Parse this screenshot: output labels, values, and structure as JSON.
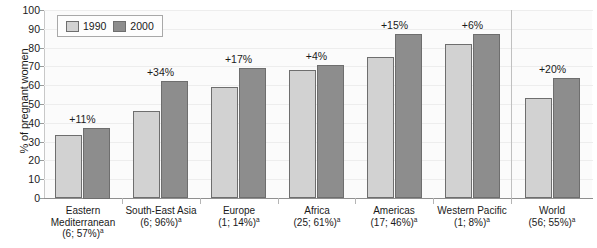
{
  "chart_data": {
    "type": "bar",
    "title": "",
    "xlabel": "",
    "ylabel": "% of pregnant women",
    "ylim": [
      0,
      100
    ],
    "ytick_labels": [
      "100",
      "90",
      "80",
      "70",
      "60",
      "50",
      "40",
      "30",
      "20",
      "10",
      "0"
    ],
    "ytick_values": [
      100,
      90,
      80,
      70,
      60,
      50,
      40,
      30,
      20,
      10,
      0
    ],
    "grid": true,
    "legend_position": "top-left",
    "categories": [
      "Eastern Mediterranean",
      "South-East Asia",
      "Europe",
      "Africa",
      "Americas",
      "Western Pacific",
      "World"
    ],
    "category_sublabels": [
      "(6; 57%)",
      "(6; 96%)",
      "(1; 14%)",
      "(25; 61%)",
      "(17; 46%)",
      "(1; 8%)",
      "(56; 55%)"
    ],
    "category_sublabel_superscript": "a",
    "series": [
      {
        "name": "1990",
        "color": "#d2d2d2",
        "values": [
          33.5,
          46.5,
          59,
          68,
          75,
          82,
          53
        ]
      },
      {
        "name": "2000",
        "color": "#8d8d8d",
        "values": [
          37.5,
          62,
          69,
          71,
          87,
          87,
          64
        ]
      }
    ],
    "annotations": [
      "+11%",
      "+34%",
      "+17%",
      "+4%",
      "+15%",
      "+6%",
      "+20%"
    ],
    "separator_after_category_index": 5
  },
  "legend": {
    "items": [
      {
        "label": "1990",
        "color": "#d2d2d2"
      },
      {
        "label": "2000",
        "color": "#8d8d8d"
      }
    ]
  },
  "axis": {
    "y_title": "% of pregnant women"
  }
}
